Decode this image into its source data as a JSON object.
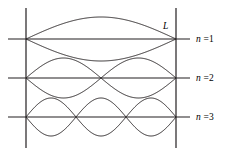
{
  "figure": {
    "background_color": "#ffffff",
    "stroke_color": "#231f20",
    "width": 229,
    "height": 155,
    "length_label": "L",
    "walls": {
      "left_x": 26,
      "right_x": 176,
      "top_y": 8,
      "bottom_y": 148
    },
    "axis_extent": {
      "x_start": 8,
      "x_end": 190
    }
  },
  "modes": [
    {
      "name": "mode-n1",
      "label_var": "n",
      "label_rest": " =1",
      "harmonic": 1,
      "loops": 1,
      "axis_y": 39,
      "amplitude": 22,
      "label_x": 196,
      "label_y": 34
    },
    {
      "name": "mode-n2",
      "label_var": "n",
      "label_rest": " =2",
      "harmonic": 2,
      "loops": 2,
      "axis_y": 78,
      "amplitude": 20,
      "label_x": 196,
      "label_y": 73
    },
    {
      "name": "mode-n3",
      "label_var": "n",
      "label_rest": " =3",
      "harmonic": 3,
      "loops": 3,
      "axis_y": 117,
      "amplitude": 19,
      "label_x": 196,
      "label_y": 112
    }
  ],
  "length_marker": {
    "text": "L",
    "x": 163,
    "y": 21
  },
  "chart_data": {
    "type": "line",
    "xlabel": "",
    "ylabel": "",
    "x": [
      0,
      1
    ],
    "xlim": [
      0,
      1
    ],
    "series": [
      {
        "name": "n =1",
        "harmonic": 1,
        "nodes": 2,
        "antinodes": 1,
        "wavelength_over_L": 2.0
      },
      {
        "name": "n =2",
        "harmonic": 2,
        "nodes": 3,
        "antinodes": 2,
        "wavelength_over_L": 1.0
      },
      {
        "name": "n =3",
        "harmonic": 3,
        "nodes": 4,
        "antinodes": 3,
        "wavelength_over_L": 0.6667
      }
    ],
    "annotations": [
      "L"
    ],
    "grid": false,
    "legend": "right"
  }
}
